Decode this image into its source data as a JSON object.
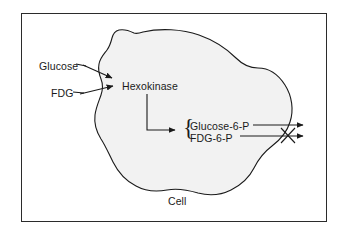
{
  "figure": {
    "frame_border_color": "#2b2b2b",
    "cell_fill_color": "#f2f2f2",
    "cell_outline_color": "#1a1a1a",
    "text_color": "#1a1a1a"
  },
  "labels": {
    "glucose": "Glucose",
    "fdg": "FDG",
    "hexokinase": "Hexokinase",
    "glucose_6_p": "Glucose-6-P",
    "fdg_6_p": "FDG-6-P",
    "cell": "Cell",
    "brace": "{"
  },
  "diagram_data": {
    "type": "diagram",
    "nodes": [
      {
        "id": "glucose",
        "label": "Glucose",
        "kind": "substrate",
        "location": "extracellular",
        "x": 39,
        "y": 61
      },
      {
        "id": "fdg",
        "label": "FDG",
        "kind": "substrate",
        "location": "extracellular",
        "x": 51,
        "y": 88
      },
      {
        "id": "hexokinase",
        "label": "Hexokinase",
        "kind": "enzyme",
        "location": "intracellular",
        "x": 122,
        "y": 81
      },
      {
        "id": "glucose-6-p",
        "label": "Glucose-6-P",
        "kind": "product",
        "location": "intracellular",
        "x": 190,
        "y": 121
      },
      {
        "id": "fdg-6-p",
        "label": "FDG-6-P",
        "kind": "product",
        "location": "intracellular",
        "x": 190,
        "y": 133
      },
      {
        "id": "cell",
        "label": "Cell",
        "kind": "compartment",
        "location": "caption",
        "x": 168,
        "y": 196
      }
    ],
    "edges": [
      {
        "from": "glucose",
        "to": "hexokinase",
        "kind": "uptake-arrow",
        "blocked": false
      },
      {
        "from": "fdg",
        "to": "hexokinase",
        "kind": "uptake-arrow",
        "blocked": false
      },
      {
        "from": "hexokinase",
        "to": "glucose-6-p",
        "kind": "phosphorylation-arrow",
        "blocked": false
      },
      {
        "from": "hexokinase",
        "to": "fdg-6-p",
        "kind": "phosphorylation-arrow",
        "blocked": false
      },
      {
        "from": "glucose-6-p",
        "to": "extracellular",
        "kind": "efflux-arrow",
        "blocked": false
      },
      {
        "from": "fdg-6-p",
        "to": "extracellular",
        "kind": "efflux-arrow",
        "blocked": true
      }
    ],
    "annotations": [
      {
        "id": "block-x",
        "symbol": "X",
        "meaning": "FDG-6-P efflux blocked (metabolic trapping)",
        "x": 288,
        "y": 134
      }
    ]
  }
}
